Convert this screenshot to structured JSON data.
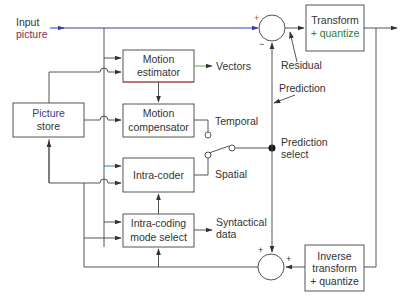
{
  "diagram": {
    "colors": {
      "line": "#555555",
      "input_line": "#3a3aa8",
      "input_text_accent": "#8a2a4a",
      "quantize_text": "#2e7d32",
      "vectors_line": "#4caf50",
      "estimator_bottom_edge": "#d04050",
      "text": "#333333"
    },
    "labels": {
      "input_line1": "Input",
      "input_line2": "picture",
      "residual": "Residual",
      "prediction": "Prediction",
      "vectors": "Vectors",
      "temporal": "Temporal",
      "spatial": "Spatial",
      "prediction_select_line1": "Prediction",
      "prediction_select_line2": "select",
      "syntactical_line1": "Syntactical",
      "syntactical_line2": "data"
    },
    "blocks": {
      "transform": {
        "line1": "Transform",
        "line2": "+ quantize"
      },
      "motion_estimator": {
        "line1": "Motion",
        "line2": "estimator"
      },
      "motion_compensator": {
        "line1": "Motion",
        "line2": "compensator"
      },
      "picture_store": {
        "line1": "Picture",
        "line2": "store"
      },
      "intra_coder": {
        "line1": "Intra-coder"
      },
      "intra_mode_select": {
        "line1": "Intra-coding",
        "line2": "mode select"
      },
      "inverse_transform": {
        "line1": "Inverse",
        "line2": "transform",
        "line3": "+ quantize"
      }
    },
    "summers": {
      "top": {
        "plus": "+",
        "minus": "−"
      },
      "bottom": {
        "plus_top": "+",
        "plus_right": "+"
      }
    }
  }
}
